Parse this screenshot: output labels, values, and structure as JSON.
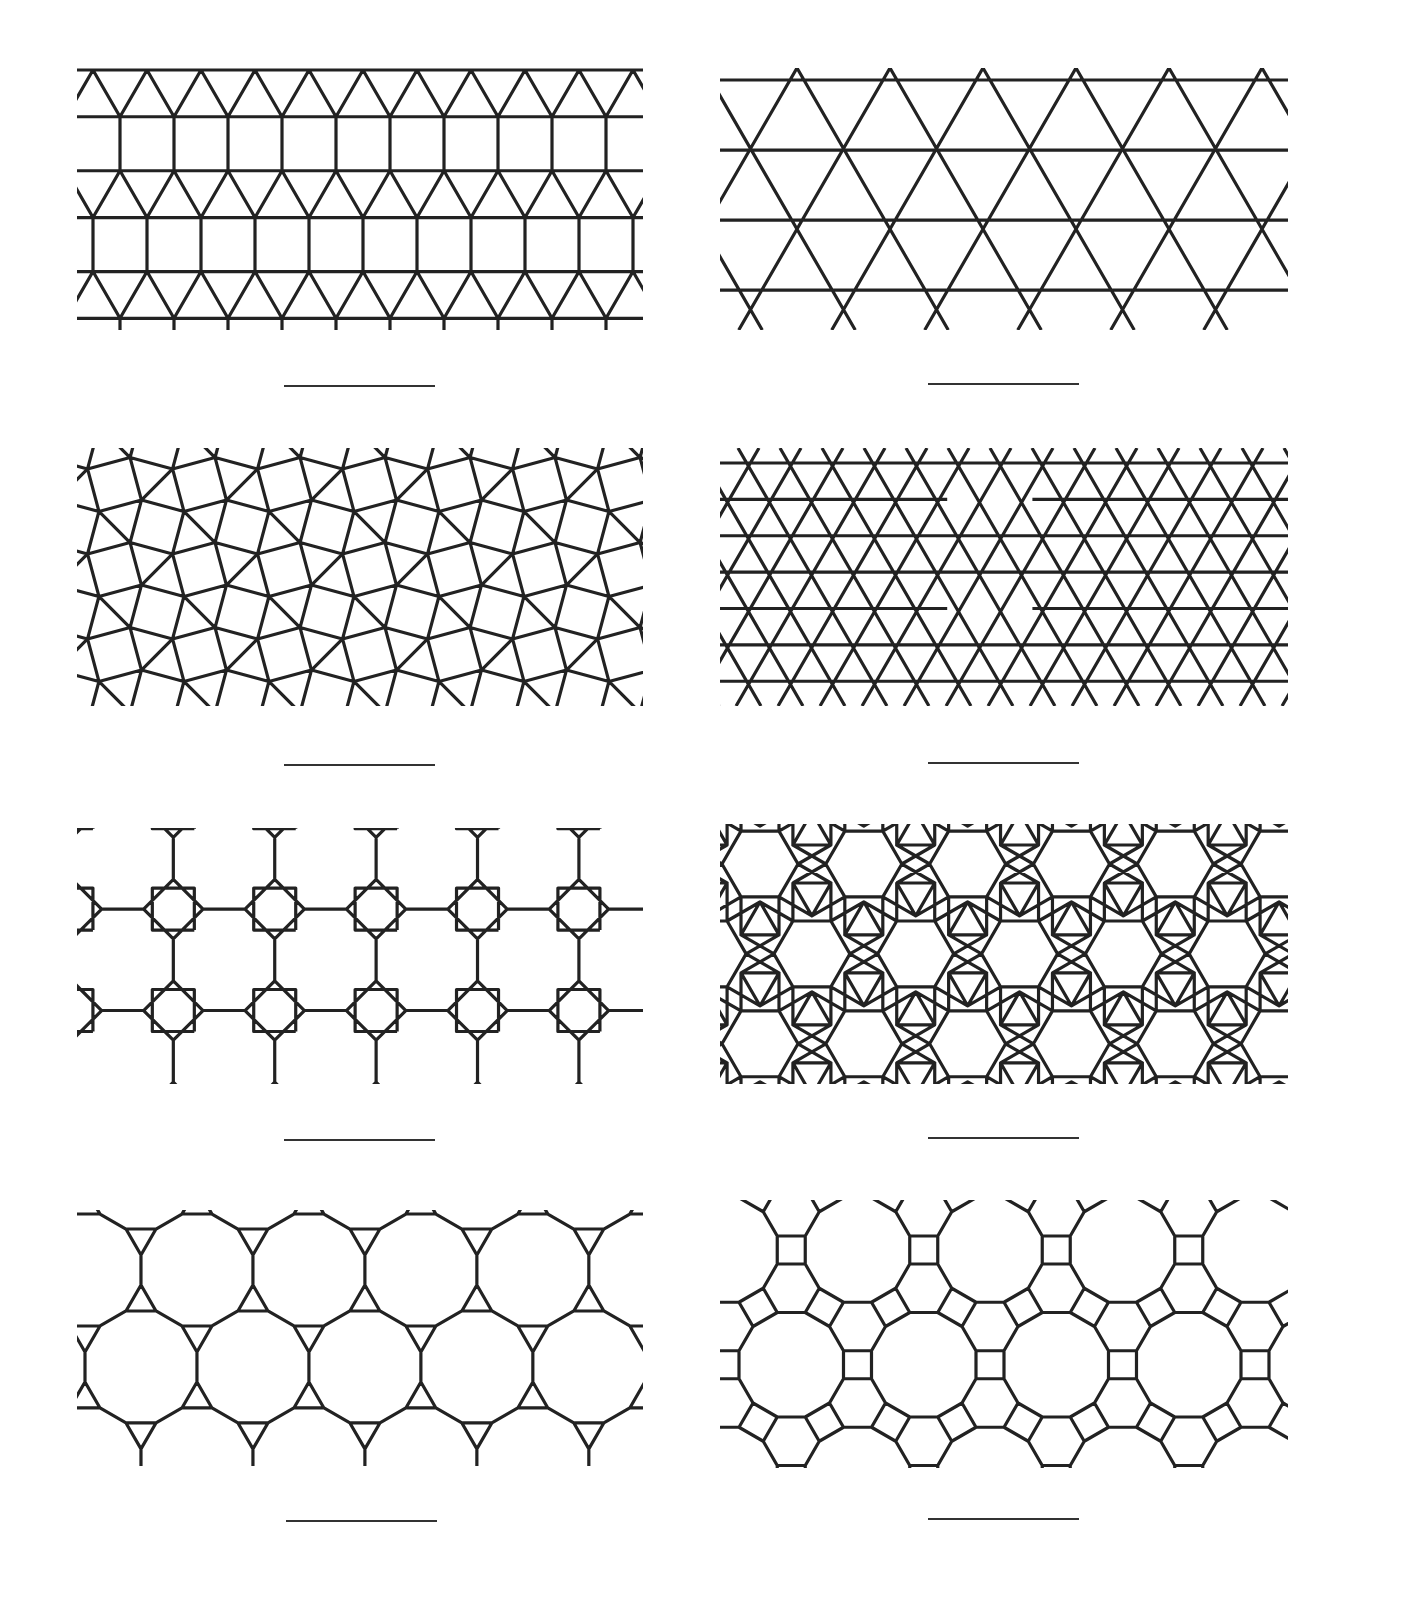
{
  "worksheet": {
    "stroke_color": "#222222",
    "stroke_width": 3.2,
    "panels": [
      {
        "id": "p1",
        "tiling": "elongated-triangular",
        "vertex_config": "3.3.3.4.4",
        "x": 77,
        "y": 68,
        "w": 566,
        "h": 262,
        "scale": 54,
        "ox": 16,
        "oy": 2,
        "blank": {
          "x": 284,
          "y": 385,
          "w": 151
        }
      },
      {
        "id": "p2",
        "tiling": "trihexagonal",
        "vertex_config": "3.6.3.6",
        "x": 720,
        "y": 68,
        "w": 568,
        "h": 262,
        "scale": 93,
        "ox": 60,
        "oy": 12,
        "blank": {
          "x": 928,
          "y": 383,
          "w": 151
        }
      },
      {
        "id": "p3",
        "tiling": "snub-square",
        "vertex_config": "3.3.4.3.4",
        "x": 77,
        "y": 448,
        "w": 566,
        "h": 258,
        "scale": 44,
        "ox": -5,
        "oy": -6,
        "blank": {
          "x": 284,
          "y": 764,
          "w": 151
        }
      },
      {
        "id": "p4",
        "tiling": "kagome-variant",
        "vertex_config": "3.3.6.6 / 3.6.3.6",
        "x": 720,
        "y": 448,
        "w": 568,
        "h": 258,
        "scale": 42,
        "ox": -18,
        "oy": 15,
        "blank": {
          "x": 928,
          "y": 762,
          "w": 151
        }
      },
      {
        "id": "p5",
        "tiling": "truncated-square",
        "vertex_config": "4.8.8",
        "x": 77,
        "y": 828,
        "w": 566,
        "h": 256,
        "scale": 42,
        "ox": 0,
        "oy": 0,
        "blank": {
          "x": 284,
          "y": 1139,
          "w": 151
        }
      },
      {
        "id": "p6",
        "tiling": "rhombitrihexagonal",
        "vertex_config": "3.4.6.4",
        "x": 720,
        "y": 824,
        "w": 568,
        "h": 260,
        "scale": 38,
        "ox": 0,
        "oy": 0,
        "blank": {
          "x": 928,
          "y": 1137,
          "w": 151
        }
      },
      {
        "id": "p7",
        "tiling": "truncated-hexagonal",
        "vertex_config": "3.12.12",
        "x": 77,
        "y": 1210,
        "w": 566,
        "h": 256,
        "scale": 30,
        "ox": 0,
        "oy": 0,
        "blank": {
          "x": 286,
          "y": 1520,
          "w": 151
        }
      },
      {
        "id": "p8",
        "tiling": "truncated-trihexagonal",
        "vertex_config": "4.6.12",
        "x": 720,
        "y": 1200,
        "w": 568,
        "h": 268,
        "scale": 28,
        "ox": 0,
        "oy": 0,
        "blank": {
          "x": 928,
          "y": 1518,
          "w": 151
        }
      }
    ]
  }
}
